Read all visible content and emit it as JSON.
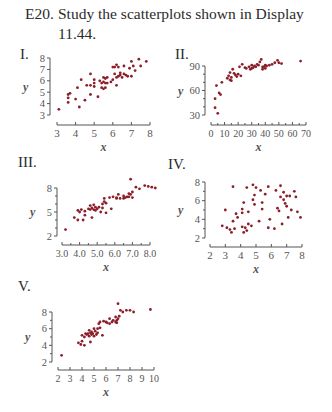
{
  "exercise": {
    "number": "E20.",
    "text_line1": "Study the scatterplots shown in Display",
    "text_line2": "11.44."
  },
  "dot_color": "#8b1f2a",
  "axis_color": "#555555",
  "chart_data": [
    {
      "id": "I",
      "label": "I.",
      "type": "scatter",
      "xlabel": "x",
      "ylabel": "y",
      "xlim": [
        3,
        8
      ],
      "ylim": [
        3,
        8
      ],
      "xticks": [
        3,
        4,
        5,
        6,
        7,
        8
      ],
      "yticks": [
        3,
        4,
        5,
        6,
        7,
        8
      ],
      "xtick_labels": [
        "3",
        "4",
        "5",
        "6",
        "7",
        "8"
      ],
      "ytick_labels": [
        "3",
        "4",
        "5",
        "6",
        "7",
        "8"
      ],
      "frame": {
        "left": 57,
        "right": 150,
        "top": 58,
        "bottom": 115,
        "xaxis_y": 125,
        "yaxis_x": 50
      },
      "x": [
        3.1,
        3.6,
        3.6,
        3.6,
        3.7,
        4.0,
        4.1,
        4.2,
        4.3,
        4.5,
        4.6,
        4.8,
        4.8,
        4.8,
        5.0,
        5.0,
        5.0,
        5.2,
        5.3,
        5.4,
        5.4,
        5.5,
        5.5,
        5.5,
        5.6,
        5.6,
        5.6,
        5.7,
        5.7,
        5.9,
        6.0,
        6.0,
        6.1,
        6.1,
        6.2,
        6.2,
        6.2,
        6.3,
        6.3,
        6.4,
        6.4,
        6.5,
        6.6,
        6.6,
        6.7,
        6.8,
        6.9,
        7.0,
        7.0,
        7.1,
        7.2,
        7.4,
        7.5,
        7.8
      ],
      "y": [
        3.5,
        4.8,
        4.5,
        4.1,
        4.9,
        4.4,
        5.4,
        3.7,
        6.1,
        4.3,
        5.6,
        5.6,
        4.8,
        6.6,
        6.1,
        5.8,
        5.5,
        4.6,
        6.0,
        5.4,
        5.8,
        6.3,
        5.3,
        5.9,
        6.2,
        5.8,
        5.4,
        5.8,
        6.3,
        5.9,
        7.2,
        6.1,
        7.2,
        6.6,
        7.4,
        6.3,
        5.6,
        7.2,
        6.4,
        6.7,
        6.5,
        6.3,
        7.3,
        6.6,
        6.5,
        6.4,
        7.1,
        7.7,
        6.4,
        7.3,
        6.9,
        7.9,
        7.3,
        7.7
      ]
    },
    {
      "id": "II",
      "label": "II.",
      "type": "scatter",
      "xlabel": "x",
      "ylabel": "y",
      "xlim": [
        0,
        70
      ],
      "ylim": [
        30,
        90
      ],
      "xticks": [
        0,
        10,
        20,
        30,
        40,
        50,
        60,
        70
      ],
      "yticks": [
        30,
        60,
        90
      ],
      "xtick_labels": [
        "0",
        "10",
        "20",
        "30",
        "40",
        "50",
        "60",
        "70"
      ],
      "ytick_labels": [
        "30",
        "60",
        "90"
      ],
      "frame": {
        "left": 211,
        "right": 306,
        "top": 66,
        "bottom": 115,
        "xaxis_y": 125,
        "yaxis_x": 205
      },
      "x": [
        3,
        3,
        4,
        5,
        6,
        7,
        8,
        12,
        13,
        14,
        14,
        15,
        15,
        16,
        17,
        18,
        19,
        20,
        21,
        22,
        23,
        25,
        26,
        28,
        29,
        30,
        30,
        31,
        32,
        33,
        34,
        35,
        36,
        37,
        38,
        38,
        39,
        40,
        40,
        41,
        43,
        45,
        47,
        49,
        50,
        52,
        66
      ],
      "y": [
        39,
        50,
        66,
        32,
        57,
        55,
        70,
        75,
        78,
        82,
        73,
        72,
        76,
        86,
        81,
        79,
        77,
        80,
        89,
        78,
        92,
        88,
        87,
        89,
        86,
        91,
        87,
        88,
        90,
        89,
        92,
        91,
        95,
        98,
        89,
        86,
        89,
        91,
        87,
        90,
        91,
        92,
        94,
        97,
        94,
        93,
        96
      ]
    },
    {
      "id": "III",
      "label": "III.",
      "type": "scatter",
      "xlabel": "x",
      "ylabel": "y",
      "xlim": [
        3.0,
        8.0
      ],
      "ylim": [
        2,
        8
      ],
      "xticks": [
        3.0,
        4.0,
        5.0,
        6.0,
        7.0,
        8.0
      ],
      "yticks": [
        2,
        5,
        8
      ],
      "xtick_labels": [
        "3.0",
        "4.0",
        "5.0",
        "6.0",
        "7.0",
        "8.0"
      ],
      "ytick_labels": [
        "2",
        "5",
        "8"
      ],
      "frame": {
        "left": 62,
        "right": 150,
        "top": 188,
        "bottom": 236,
        "xaxis_y": 245,
        "yaxis_x": 57
      },
      "x": [
        3.2,
        3.7,
        3.9,
        3.9,
        4.0,
        4.1,
        4.2,
        4.3,
        4.3,
        4.5,
        4.6,
        4.6,
        4.7,
        4.7,
        4.8,
        4.8,
        4.9,
        4.9,
        5.0,
        5.1,
        5.2,
        5.3,
        5.3,
        5.4,
        5.4,
        5.5,
        5.5,
        5.7,
        5.8,
        5.9,
        6.1,
        6.1,
        6.2,
        6.3,
        6.5,
        6.5,
        6.6,
        6.7,
        6.8,
        6.8,
        6.9,
        6.9,
        7.0,
        7.0,
        7.2,
        7.4,
        7.7,
        7.9,
        8.1,
        8.3
      ],
      "y": [
        2.8,
        4.3,
        4.0,
        5.2,
        5.0,
        5.3,
        4.0,
        4.6,
        5.1,
        5.4,
        5.3,
        5.8,
        4.3,
        5.5,
        5.3,
        5.9,
        5.6,
        5.2,
        5.4,
        5.6,
        5.0,
        5.5,
        6.0,
        6.3,
        6.7,
        4.9,
        6.1,
        6.8,
        5.4,
        6.9,
        6.8,
        6.7,
        7.2,
        6.7,
        6.7,
        7.0,
        6.8,
        6.9,
        7.3,
        6.9,
        7.2,
        9.1,
        7.5,
        6.8,
        8.1,
        7.9,
        8.3,
        8.2,
        8.1,
        8.0
      ]
    },
    {
      "id": "IV",
      "label": "IV.",
      "type": "scatter",
      "xlabel": "x",
      "ylabel": "y",
      "xlim": [
        2,
        8
      ],
      "ylim": [
        2,
        8
      ],
      "xticks": [
        2,
        3,
        4,
        5,
        6,
        7,
        8
      ],
      "yticks": [
        2,
        4,
        6,
        8
      ],
      "xtick_labels": [
        "2",
        "3",
        "4",
        "5",
        "6",
        "7",
        "8"
      ],
      "ytick_labels": [
        "2",
        "4",
        "6",
        "8"
      ],
      "frame": {
        "left": 210,
        "right": 302,
        "top": 182,
        "bottom": 238,
        "xaxis_y": 247,
        "yaxis_x": 205
      },
      "x": [
        2.8,
        3.0,
        3.1,
        3.3,
        3.4,
        3.5,
        3.5,
        3.6,
        3.7,
        3.8,
        4.1,
        4.1,
        4.1,
        4.2,
        4.2,
        4.3,
        4.4,
        4.4,
        4.5,
        4.5,
        4.7,
        4.8,
        4.8,
        4.9,
        4.9,
        5.0,
        5.2,
        5.3,
        5.4,
        5.4,
        5.6,
        5.8,
        5.8,
        5.9,
        6.2,
        6.3,
        6.4,
        6.5,
        6.6,
        6.6,
        6.7,
        6.8,
        6.8,
        6.9,
        7.0,
        7.0,
        7.1,
        7.2,
        7.3,
        7.5,
        7.6,
        7.7,
        7.9
      ],
      "y": [
        3.3,
        5.0,
        3.1,
        2.9,
        2.6,
        7.5,
        3.8,
        3.0,
        4.6,
        4.2,
        5.1,
        4.7,
        3.2,
        5.8,
        2.6,
        3.1,
        2.8,
        7.4,
        3.5,
        4.8,
        3.3,
        6.1,
        7.7,
        5.6,
        6.6,
        7.4,
        3.8,
        7.1,
        5.8,
        5.1,
        6.7,
        7.5,
        3.1,
        4.0,
        3.0,
        7.1,
        5.2,
        4.9,
        7.6,
        6.4,
        3.5,
        6.9,
        6.1,
        5.7,
        6.5,
        5.4,
        4.2,
        6.5,
        5.0,
        7.0,
        6.4,
        4.8,
        4.2
      ]
    },
    {
      "id": "V",
      "label": "V.",
      "type": "scatter",
      "xlabel": "x",
      "ylabel": "y",
      "xlim": [
        2,
        10
      ],
      "ylim": [
        2,
        8
      ],
      "xticks": [
        2,
        3,
        4,
        5,
        6,
        7,
        8,
        9,
        10
      ],
      "yticks": [
        2,
        4,
        6,
        8
      ],
      "xtick_labels": [
        "2",
        "3",
        "4",
        "5",
        "6",
        "7",
        "8",
        "9",
        "10"
      ],
      "ytick_labels": [
        "2",
        "4",
        "6",
        "8"
      ],
      "frame": {
        "left": 58,
        "right": 154,
        "top": 312,
        "bottom": 362,
        "xaxis_y": 370,
        "yaxis_x": 52
      },
      "x": [
        2.3,
        3.7,
        3.9,
        4.0,
        4.0,
        4.2,
        4.2,
        4.3,
        4.4,
        4.5,
        4.6,
        4.6,
        4.7,
        4.7,
        4.8,
        4.8,
        4.9,
        5.0,
        5.0,
        5.1,
        5.2,
        5.3,
        5.3,
        5.4,
        5.5,
        5.5,
        5.7,
        5.8,
        6.0,
        6.1,
        6.3,
        6.3,
        6.5,
        6.6,
        6.8,
        6.8,
        6.9,
        6.9,
        7.0,
        7.0,
        7.1,
        7.2,
        7.4,
        7.7,
        8.0,
        8.3,
        9.7
      ],
      "y": [
        2.8,
        4.3,
        4.1,
        5.2,
        4.5,
        5.0,
        4.0,
        5.4,
        5.3,
        5.4,
        5.8,
        5.1,
        5.5,
        4.4,
        5.6,
        5.3,
        5.4,
        5.1,
        6.0,
        5.7,
        5.3,
        6.0,
        5.5,
        6.6,
        6.8,
        6.1,
        5.2,
        6.9,
        6.8,
        6.7,
        7.2,
        6.6,
        6.8,
        7.0,
        7.4,
        6.8,
        7.0,
        6.7,
        9.0,
        7.2,
        7.5,
        8.2,
        8.0,
        8.2,
        8.2,
        8.0,
        8.3
      ]
    }
  ]
}
